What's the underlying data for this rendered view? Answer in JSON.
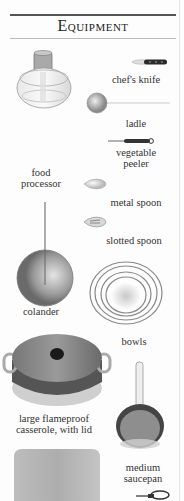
{
  "header": {
    "title": "Equipment"
  },
  "items": [
    {
      "label": "chef's knife",
      "icon": "chef-knife-icon"
    },
    {
      "label": "ladle",
      "icon": "ladle-icon"
    },
    {
      "label": "vegetable peeler",
      "line1": "vegetable",
      "line2": "peeler",
      "icon": "peeler-icon"
    },
    {
      "label": "food processor",
      "line1": "food",
      "line2": "processor",
      "icon": "food-processor-icon"
    },
    {
      "label": "metal spoon",
      "icon": "metal-spoon-icon"
    },
    {
      "label": "slotted spoon",
      "icon": "slotted-spoon-icon"
    },
    {
      "label": "colander",
      "icon": "colander-icon"
    },
    {
      "label": "bowls",
      "icon": "bowls-icon"
    },
    {
      "label": "large flameproof casserole, with lid",
      "line1": "large flameproof",
      "line2": "casserole, with lid",
      "icon": "casserole-icon"
    },
    {
      "label": "medium saucepan",
      "line1": "medium",
      "line2": "saucepan",
      "icon": "saucepan-icon"
    },
    {
      "label": "",
      "icon": "baking-tray-icon"
    },
    {
      "label": "",
      "icon": "scissors-icon"
    }
  ]
}
